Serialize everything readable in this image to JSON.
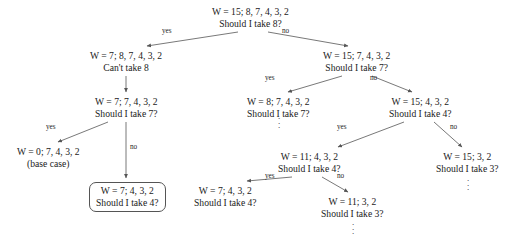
{
  "figure": {
    "type": "recursion-tree-diagram",
    "title": "",
    "background_color": "#ffffff",
    "text_color": "#1a1a1a",
    "edge_color": "#555555"
  },
  "nodes": [
    {
      "id": "root",
      "line1": "W = 15; 8, 7, 4, 3, 2",
      "line2": "Should I take 8?",
      "boxed": false,
      "x": 250,
      "y": 6
    },
    {
      "id": "n-left-1",
      "line1": "W = 7; 8, 7, 4, 3, 2",
      "line2": "Can't take 8",
      "boxed": false,
      "x": 126,
      "y": 50
    },
    {
      "id": "n-right-1",
      "line1": "W = 15; 7, 4, 3, 2",
      "line2": "Should I take 7?",
      "boxed": false,
      "x": 356,
      "y": 50
    },
    {
      "id": "n-left-2",
      "line1": "W = 7; 7, 4, 3, 2",
      "line2": "Should I take 7?",
      "boxed": false,
      "x": 126,
      "y": 96
    },
    {
      "id": "n-mid-2",
      "line1": "W = 8; 7, 4, 3, 2",
      "line2": "Should I take 7?",
      "boxed": false,
      "x": 278,
      "y": 96
    },
    {
      "id": "n-right-2",
      "line1": "W = 15; 4, 3, 2",
      "line2": "Should I take 4?",
      "boxed": false,
      "x": 420,
      "y": 96
    },
    {
      "id": "n-base-case",
      "line1": "W = 0; 7, 4, 3, 2",
      "line2": "(base case)",
      "boxed": false,
      "x": 48,
      "y": 146
    },
    {
      "id": "n-left-3-boxed",
      "line1": "W = 7; 4, 3, 2",
      "line2": "Should I take 4?",
      "boxed": true,
      "x": 127,
      "y": 182
    },
    {
      "id": "n-left-3-dup",
      "line1": "W = 7; 4, 3, 2",
      "line2": "Should I take 4?",
      "boxed": false,
      "x": 225,
      "y": 185
    },
    {
      "id": "n-mid-3",
      "line1": "W = 11; 4, 3, 2",
      "line2": "Should I take 4?",
      "boxed": false,
      "x": 309,
      "y": 151
    },
    {
      "id": "n-right-3",
      "line1": "W = 15; 3, 2",
      "line2": "Should I take 3?",
      "boxed": false,
      "x": 467,
      "y": 151
    },
    {
      "id": "n-mid-4",
      "line1": "W = 11; 3, 2",
      "line2": "Should I take 3?",
      "boxed": false,
      "x": 352,
      "y": 196
    }
  ],
  "edges": [
    {
      "id": "root-yes",
      "label": "yes",
      "label_x": 162,
      "label_y": 27,
      "x1": 238,
      "y1": 32,
      "x2": 147,
      "y2": 46
    },
    {
      "id": "root-no",
      "label": "no",
      "label_x": 282,
      "label_y": 27,
      "x1": 268,
      "y1": 32,
      "x2": 348,
      "y2": 46
    },
    {
      "id": "left1-down",
      "label": "",
      "label_x": 0,
      "label_y": 0,
      "x1": 126,
      "y1": 76,
      "x2": 126,
      "y2": 92
    },
    {
      "id": "right1-yes",
      "label": "yes",
      "label_x": 265,
      "label_y": 74,
      "x1": 342,
      "y1": 76,
      "x2": 288,
      "y2": 92
    },
    {
      "id": "right1-no",
      "label": "no",
      "label_x": 370,
      "label_y": 74,
      "x1": 372,
      "y1": 76,
      "x2": 412,
      "y2": 92
    },
    {
      "id": "left2-yes",
      "label": "yes",
      "label_x": 46,
      "label_y": 123,
      "x1": 108,
      "y1": 122,
      "x2": 58,
      "y2": 142
    },
    {
      "id": "left2-no",
      "label": "no",
      "label_x": 130,
      "label_y": 143,
      "x1": 126,
      "y1": 122,
      "x2": 126,
      "y2": 178
    },
    {
      "id": "right2-yes",
      "label": "yes",
      "label_x": 337,
      "label_y": 123,
      "x1": 404,
      "y1": 122,
      "x2": 338,
      "y2": 147
    },
    {
      "id": "right2-no",
      "label": "no",
      "label_x": 450,
      "label_y": 123,
      "x1": 434,
      "y1": 122,
      "x2": 462,
      "y2": 147
    },
    {
      "id": "mid3-yes",
      "label": "yes",
      "label_x": 265,
      "label_y": 172,
      "x1": 292,
      "y1": 177,
      "x2": 247,
      "y2": 181
    },
    {
      "id": "mid3-no",
      "label": "no",
      "label_x": 337,
      "label_y": 172,
      "x1": 322,
      "y1": 177,
      "x2": 348,
      "y2": 192
    }
  ],
  "dots": [
    {
      "id": "dots-mid-2",
      "x": 274,
      "y": 114
    },
    {
      "id": "dots-right-3",
      "x": 463,
      "y": 176
    },
    {
      "id": "dots-mid-4",
      "x": 348,
      "y": 220
    }
  ],
  "dot_glyph": "."
}
